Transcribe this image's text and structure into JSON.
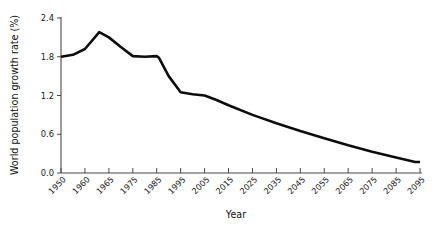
{
  "chart_data": {
    "type": "line",
    "title": "",
    "xlabel": "Year",
    "ylabel": "World population growth rate (%)",
    "xlim": [
      1950,
      2095
    ],
    "ylim": [
      0.0,
      2.4
    ],
    "grid": false,
    "legend": null,
    "ytick_labels": [
      "0.0",
      "0.6",
      "1.2",
      "1.8",
      "2.4"
    ],
    "ytick_values": [
      0.0,
      0.6,
      1.2,
      1.8,
      2.4
    ],
    "xtick_labels": [
      "1950",
      "1960",
      "1965",
      "1975",
      "1985",
      "1995",
      "2005",
      "2015",
      "2025",
      "2035",
      "2045",
      "2055",
      "2065",
      "2075",
      "2085",
      "2095"
    ],
    "xtick_values": [
      1950,
      1960,
      1965,
      1975,
      1985,
      1995,
      2005,
      2015,
      2025,
      2035,
      2045,
      2055,
      2065,
      2075,
      2085,
      2095
    ],
    "series": [
      {
        "name": "World population growth rate",
        "color": "#0d0d0d",
        "x": [
          1950,
          1955,
          1960,
          1963,
          1965,
          1970,
          1975,
          1980,
          1985,
          1986,
          1990,
          1995,
          2000,
          2005,
          2010,
          2015,
          2025,
          2035,
          2045,
          2055,
          2065,
          2075,
          2085,
          2093,
          2095
        ],
        "values": [
          1.8,
          1.83,
          1.92,
          2.18,
          2.1,
          1.95,
          1.81,
          1.8,
          1.81,
          1.78,
          1.5,
          1.25,
          1.22,
          1.2,
          1.13,
          1.05,
          0.9,
          0.77,
          0.65,
          0.54,
          0.43,
          0.33,
          0.24,
          0.17,
          0.17
        ]
      }
    ]
  },
  "figure": {
    "background_color": "#ffffff",
    "axis_color": "#4a4a4a",
    "line_color": "#0d0d0d"
  }
}
